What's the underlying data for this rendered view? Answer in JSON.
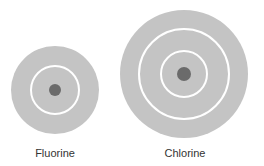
{
  "colors": {
    "cloud": "#c4c4c4",
    "ring": "#ffffff",
    "nucleus": "#6b6b6b",
    "label": "#333333"
  },
  "atoms": [
    {
      "name": "Fluorine",
      "cx": 55,
      "cy": 90,
      "outer_r": 44,
      "rings": [
        24
      ],
      "nucleus_r": 6
    },
    {
      "name": "Chlorine",
      "cx": 184,
      "cy": 74,
      "outer_r": 64,
      "rings": [
        45,
        23
      ],
      "nucleus_r": 7
    }
  ]
}
